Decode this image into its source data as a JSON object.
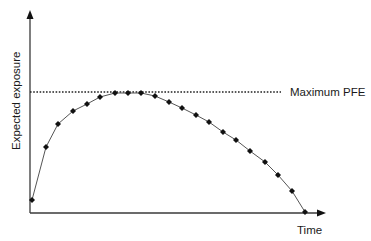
{
  "chart_data": {
    "type": "line",
    "title": "",
    "xlabel": "Time",
    "ylabel": "Expected exposure",
    "grid": false,
    "legend": null,
    "annotations": [
      {
        "type": "hline",
        "label": "Maximum PFE",
        "style": "dotted",
        "y": 1.0
      }
    ],
    "series": [
      {
        "name": "Expected exposure profile",
        "marker": "diamond",
        "x": [
          0,
          1,
          2,
          3,
          4,
          5,
          6,
          7,
          8,
          9,
          10,
          11,
          12,
          13,
          14,
          15,
          16,
          17,
          18,
          19,
          20
        ],
        "values": [
          0.11,
          0.55,
          0.74,
          0.85,
          0.91,
          0.97,
          1.0,
          1.0,
          1.0,
          0.97,
          0.92,
          0.87,
          0.81,
          0.75,
          0.67,
          0.6,
          0.51,
          0.42,
          0.31,
          0.18,
          0.0
        ]
      }
    ],
    "xlim": [
      0,
      21
    ],
    "ylim": [
      0,
      1.7
    ]
  },
  "labels": {
    "y_axis": "Expected exposure",
    "x_axis": "Time",
    "max_line": "Maximum PFE"
  },
  "geometry": {
    "origin_x": 30,
    "origin_y": 213,
    "x_end": 326,
    "y_end": 10,
    "max_line_y": 92,
    "max_line_x_end": 281,
    "points_px": [
      [
        32,
        200
      ],
      [
        46,
        147
      ],
      [
        58,
        124
      ],
      [
        73,
        111
      ],
      [
        87,
        104
      ],
      [
        100,
        97
      ],
      [
        115,
        93
      ],
      [
        128,
        93
      ],
      [
        141,
        93
      ],
      [
        155,
        96
      ],
      [
        169,
        102
      ],
      [
        182,
        108
      ],
      [
        196,
        115
      ],
      [
        209,
        122
      ],
      [
        223,
        132
      ],
      [
        236,
        140
      ],
      [
        250,
        151
      ],
      [
        265,
        162
      ],
      [
        278,
        175
      ],
      [
        292,
        191
      ],
      [
        305,
        212
      ]
    ]
  },
  "colors": {
    "axis": "#3a3a3a",
    "line": "#555555",
    "marker": "#111111",
    "dotted": "#222222",
    "text": "#1a1a1a"
  }
}
